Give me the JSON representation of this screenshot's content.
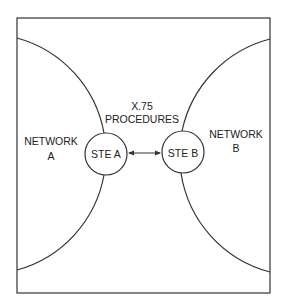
{
  "diagram": {
    "type": "network-interconnection",
    "colors": {
      "line": "#333333",
      "text": "#222222",
      "background": "#ffffff"
    },
    "frame": {
      "x": 17,
      "y": 18,
      "width": 253,
      "height": 275
    },
    "networks": [
      {
        "id": "A",
        "line1": "NETWORK",
        "line2": "A"
      },
      {
        "id": "B",
        "line1": "NETWORK",
        "line2": "B"
      }
    ],
    "nodes": [
      {
        "id": "ste_a",
        "label": "STE A",
        "cx": 106,
        "cy": 154,
        "r": 21
      },
      {
        "id": "ste_b",
        "label": "STE B",
        "cx": 183,
        "cy": 152,
        "r": 21
      }
    ],
    "link": {
      "from": "ste_a",
      "to": "ste_b",
      "direction": "bidirectional",
      "label_line1": "X.75",
      "label_line2": "PROCEDURES"
    }
  }
}
